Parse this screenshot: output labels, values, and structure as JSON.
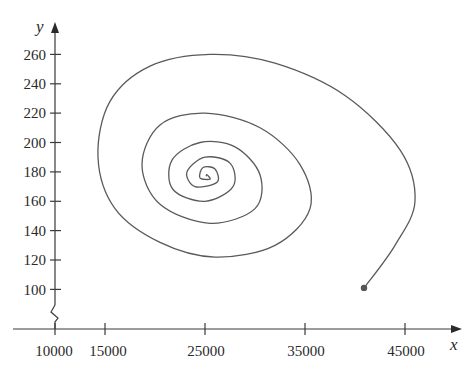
{
  "chart_data": {
    "type": "line",
    "title": "",
    "xlabel": "x",
    "ylabel": "y",
    "xlim": [
      10000,
      48000
    ],
    "ylim": [
      85,
      270
    ],
    "x_axis_break": true,
    "y_axis_break": true,
    "grid": false,
    "legend": null,
    "x_ticks": [
      10000,
      15000,
      25000,
      35000,
      45000
    ],
    "x_tick_labels": [
      "10000",
      "15000",
      "25000",
      "35000",
      "45000"
    ],
    "y_ticks": [
      100,
      120,
      140,
      160,
      180,
      200,
      220,
      240,
      260
    ],
    "y_tick_labels": [
      "100",
      "120",
      "140",
      "160",
      "180",
      "200",
      "220",
      "240",
      "260"
    ],
    "series": [
      {
        "name": "phase trajectory",
        "description": "Trajectory spiraling inward counterclockwise from the start point toward an equilibrium near (25000, 177)",
        "start_point": {
          "x": 40900,
          "y": 101
        },
        "equilibrium": {
          "x": 25100,
          "y": 177
        },
        "points": [
          {
            "x": 40900,
            "y": 101
          },
          {
            "x": 44000,
            "y": 130
          },
          {
            "x": 46000,
            "y": 160
          },
          {
            "x": 44500,
            "y": 195
          },
          {
            "x": 39000,
            "y": 232
          },
          {
            "x": 32000,
            "y": 254
          },
          {
            "x": 25500,
            "y": 260
          },
          {
            "x": 19500,
            "y": 252
          },
          {
            "x": 15500,
            "y": 228
          },
          {
            "x": 14300,
            "y": 190
          },
          {
            "x": 16000,
            "y": 155
          },
          {
            "x": 20500,
            "y": 132
          },
          {
            "x": 26000,
            "y": 122
          },
          {
            "x": 32000,
            "y": 130
          },
          {
            "x": 35500,
            "y": 155
          },
          {
            "x": 34500,
            "y": 185
          },
          {
            "x": 30500,
            "y": 210
          },
          {
            "x": 25000,
            "y": 220
          },
          {
            "x": 20500,
            "y": 212
          },
          {
            "x": 18700,
            "y": 185
          },
          {
            "x": 20500,
            "y": 158
          },
          {
            "x": 25500,
            "y": 145
          },
          {
            "x": 30000,
            "y": 155
          },
          {
            "x": 30500,
            "y": 178
          },
          {
            "x": 28000,
            "y": 197
          },
          {
            "x": 24500,
            "y": 200
          },
          {
            "x": 21700,
            "y": 188
          },
          {
            "x": 21800,
            "y": 168
          },
          {
            "x": 25000,
            "y": 160
          },
          {
            "x": 27800,
            "y": 170
          },
          {
            "x": 27500,
            "y": 186
          },
          {
            "x": 25000,
            "y": 190
          },
          {
            "x": 23200,
            "y": 180
          },
          {
            "x": 24000,
            "y": 170
          },
          {
            "x": 26200,
            "y": 173
          },
          {
            "x": 26000,
            "y": 182
          },
          {
            "x": 24800,
            "y": 183
          },
          {
            "x": 24500,
            "y": 176
          },
          {
            "x": 25500,
            "y": 175
          },
          {
            "x": 25200,
            "y": 178
          },
          {
            "x": 25100,
            "y": 177
          }
        ]
      }
    ]
  },
  "labels": {
    "x_axis": "x",
    "y_axis": "y",
    "x_ticks": [
      "10000",
      "15000",
      "25000",
      "35000",
      "45000"
    ],
    "y_ticks": [
      "100",
      "120",
      "140",
      "160",
      "180",
      "200",
      "220",
      "240",
      "260"
    ]
  }
}
